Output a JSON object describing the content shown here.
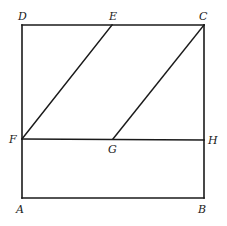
{
  "diagram": {
    "type": "geometry",
    "points": {
      "A": {
        "label": "A",
        "x": 22,
        "y": 198,
        "lx": 16,
        "ly": 213
      },
      "B": {
        "label": "B",
        "x": 204,
        "y": 198,
        "lx": 198,
        "ly": 213
      },
      "C": {
        "label": "C",
        "x": 204,
        "y": 25,
        "lx": 199,
        "ly": 20
      },
      "D": {
        "label": "D",
        "x": 22,
        "y": 25,
        "lx": 18,
        "ly": 20
      },
      "E": {
        "label": "E",
        "x": 112,
        "y": 25,
        "lx": 109,
        "ly": 20
      },
      "F": {
        "label": "F",
        "x": 22,
        "y": 139,
        "lx": 9,
        "ly": 143
      },
      "G": {
        "label": "G",
        "x": 113,
        "y": 139,
        "lx": 108,
        "ly": 153
      },
      "H": {
        "label": "H",
        "x": 204,
        "y": 140,
        "lx": 208,
        "ly": 144
      }
    },
    "segments": [
      [
        "A",
        "B"
      ],
      [
        "B",
        "C"
      ],
      [
        "C",
        "D"
      ],
      [
        "D",
        "A"
      ],
      [
        "F",
        "H"
      ],
      [
        "F",
        "E"
      ],
      [
        "G",
        "C"
      ]
    ]
  }
}
